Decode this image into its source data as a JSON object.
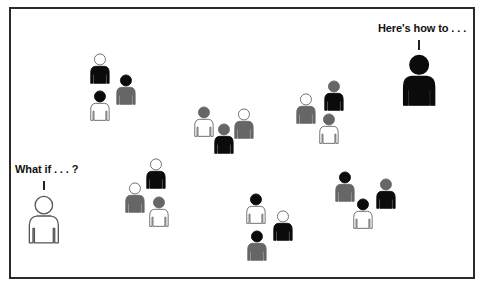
{
  "colors": {
    "black": "#0b0b0b",
    "gray": "#666666",
    "white": "#ffffff",
    "outline": "#555555",
    "frame": "#2a2a2a"
  },
  "speakers": [
    {
      "id": "expert",
      "label": "Here's how to . . .",
      "head": "black",
      "body": "black"
    },
    {
      "id": "novice",
      "label": "What if . . . ?",
      "head": "white",
      "body": "white"
    }
  ],
  "groups": [
    {
      "id": "group-a",
      "people": [
        {
          "x": 100,
          "y": 59,
          "head": "white",
          "body": "black"
        },
        {
          "x": 126,
          "y": 80,
          "head": "black",
          "body": "gray"
        },
        {
          "x": 100,
          "y": 96,
          "head": "black",
          "body": "white"
        }
      ]
    },
    {
      "id": "group-b",
      "people": [
        {
          "x": 204,
          "y": 112,
          "head": "gray",
          "body": "white"
        },
        {
          "x": 244,
          "y": 114,
          "head": "white",
          "body": "gray"
        },
        {
          "x": 224,
          "y": 129,
          "head": "gray",
          "body": "black"
        }
      ]
    },
    {
      "id": "group-c",
      "people": [
        {
          "x": 306,
          "y": 99,
          "head": "white",
          "body": "gray"
        },
        {
          "x": 334,
          "y": 86,
          "head": "gray",
          "body": "black"
        },
        {
          "x": 329,
          "y": 119,
          "head": "gray",
          "body": "white"
        }
      ]
    },
    {
      "id": "group-d",
      "people": [
        {
          "x": 156,
          "y": 164,
          "head": "white",
          "body": "black"
        },
        {
          "x": 135,
          "y": 188,
          "head": "white",
          "body": "gray"
        },
        {
          "x": 159,
          "y": 202,
          "head": "gray",
          "body": "white"
        }
      ]
    },
    {
      "id": "group-e",
      "people": [
        {
          "x": 256,
          "y": 199,
          "head": "black",
          "body": "white"
        },
        {
          "x": 283,
          "y": 216,
          "head": "white",
          "body": "black"
        },
        {
          "x": 257,
          "y": 236,
          "head": "black",
          "body": "gray"
        }
      ]
    },
    {
      "id": "group-f",
      "people": [
        {
          "x": 345,
          "y": 177,
          "head": "black",
          "body": "gray"
        },
        {
          "x": 386,
          "y": 184,
          "head": "gray",
          "body": "black"
        },
        {
          "x": 363,
          "y": 204,
          "head": "black",
          "body": "white"
        }
      ]
    }
  ]
}
